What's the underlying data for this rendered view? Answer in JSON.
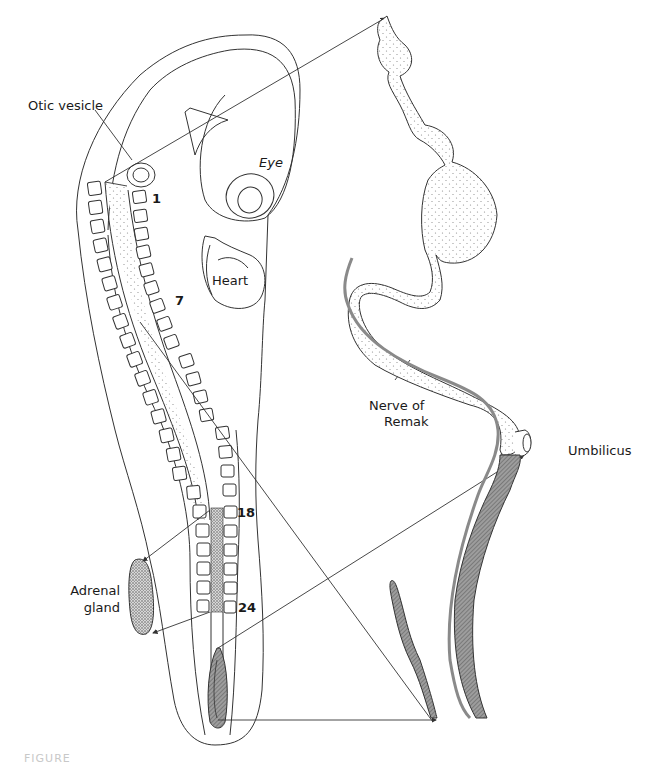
{
  "figure": {
    "type": "embryology diagram",
    "labels": {
      "otic_vesicle": "Otic vesicle",
      "eye": "Eye",
      "heart": "Heart",
      "nerve_of_remak_line1": "Nerve of",
      "nerve_of_remak_line2": "Remak",
      "umbilicus": "Umbilicus",
      "adrenal_gland_line1": "Adrenal",
      "adrenal_gland_line2": "gland"
    },
    "somite_numbers": [
      "1",
      "7",
      "18",
      "24"
    ],
    "caption_partial": "FIGURE"
  },
  "colors": {
    "line": "#333333",
    "stipple": "#9a9a9a",
    "dark_fill": "#8c8c8c",
    "background": "#ffffff"
  }
}
